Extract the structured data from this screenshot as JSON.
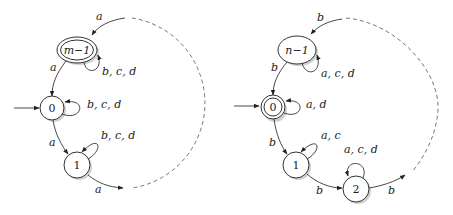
{
  "left": {
    "nodes": {
      "m1": "m−1",
      "n0": "0",
      "n1": "1"
    },
    "labels": {
      "in_m1": "a",
      "loop_m1": "b, c, d",
      "m1_to_0": "a",
      "loop_0": "b, c, d",
      "n0_to_1": "a",
      "loop_1": "b, c, d",
      "out_1": "a"
    }
  },
  "right": {
    "nodes": {
      "n1m": "n−1",
      "n0": "0",
      "n1": "1",
      "n2": "2"
    },
    "labels": {
      "in_n1m": "b",
      "loop_n1m": "a, c, d",
      "n1m_to_0": "b",
      "loop_0": "a, d",
      "n0_to_1": "b",
      "loop_1": "a, c",
      "n1_to_2": "b",
      "loop_2": "a, c, d",
      "out_2": "b"
    }
  }
}
